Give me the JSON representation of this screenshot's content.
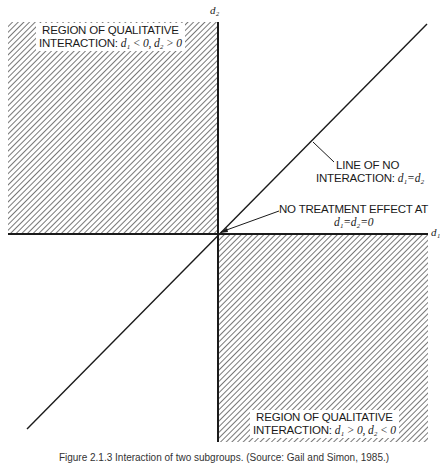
{
  "axes": {
    "x_label": "d₁",
    "y_label": "d₂"
  },
  "regions": {
    "upper_left": {
      "line1": "REGION OF QUALITATIVE",
      "line2_prefix": "INTERACTION: ",
      "line2_math": "d₁ < 0, d₂ > 0"
    },
    "lower_right": {
      "line1": "REGION OF QUALITATIVE",
      "line2_prefix": "INTERACTION: ",
      "line2_math": "d₁ > 0, d₂ < 0"
    }
  },
  "annotations": {
    "no_interaction": {
      "line1": "LINE OF NO",
      "line2_prefix": "INTERACTION: ",
      "line2_math": "d₁=d₂"
    },
    "no_effect": {
      "line1": "NO TREATMENT EFFECT AT",
      "line2_math": "d₁=d₂=0"
    }
  },
  "caption": "Figure 2.1.3  Interaction of two subgroups. (Source: Gail and Simon, 1985.)",
  "colors": {
    "ink": "#1a1a1a",
    "hatch": "#555555",
    "background": "#ffffff"
  }
}
